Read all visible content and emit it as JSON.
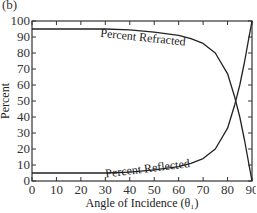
{
  "chart_data": {
    "type": "line",
    "panel_label": "(b)",
    "title": "",
    "xlabel": "Angle of Incidence (θ1)",
    "ylabel": "Percent",
    "xlim": [
      0,
      90
    ],
    "ylim": [
      0,
      100
    ],
    "x_ticks": [
      0,
      10,
      20,
      30,
      40,
      50,
      60,
      70,
      80,
      90
    ],
    "y_ticks": [
      0,
      10,
      20,
      30,
      40,
      50,
      60,
      70,
      80,
      90,
      100
    ],
    "grid": false,
    "legend": "inline curve labels",
    "x": [
      0,
      10,
      20,
      30,
      40,
      50,
      60,
      65,
      70,
      75,
      80,
      83,
      85,
      87,
      89,
      90
    ],
    "series": [
      {
        "name": "Percent Refracted",
        "values": [
          95,
          95,
          95,
          95,
          94.5,
          93,
          91,
          89,
          86,
          80,
          67,
          52,
          40,
          25,
          8,
          0
        ]
      },
      {
        "name": "Percent Reflected",
        "values": [
          5,
          5,
          5,
          5,
          5.5,
          7,
          9,
          11,
          14,
          20,
          33,
          48,
          60,
          75,
          92,
          100
        ]
      }
    ]
  }
}
